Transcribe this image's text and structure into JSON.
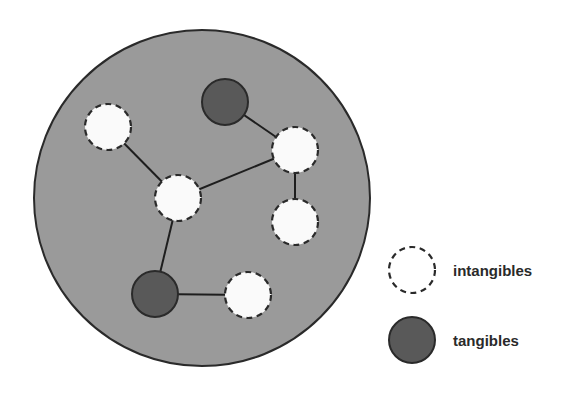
{
  "diagram": {
    "type": "network-in-container",
    "container": {
      "cx": 202,
      "cy": 198,
      "r": 168,
      "fill": "#9a9a9a",
      "stroke": "#2a2a2a"
    },
    "node_radius": 23,
    "colors": {
      "intangible_fill": "#fafafa",
      "intangible_stroke": "#2a2a2a",
      "tangible_fill": "#595959",
      "tangible_stroke": "#2a2a2a",
      "edge": "#1e1e1e"
    },
    "nodes": [
      {
        "id": "n1",
        "kind": "intangible",
        "x": 108,
        "y": 127
      },
      {
        "id": "n2",
        "kind": "tangible",
        "x": 225,
        "y": 102
      },
      {
        "id": "n3",
        "kind": "intangible",
        "x": 295,
        "y": 150
      },
      {
        "id": "n4",
        "kind": "intangible",
        "x": 178,
        "y": 198
      },
      {
        "id": "n5",
        "kind": "intangible",
        "x": 295,
        "y": 222
      },
      {
        "id": "n6",
        "kind": "tangible",
        "x": 155,
        "y": 294
      },
      {
        "id": "n7",
        "kind": "intangible",
        "x": 248,
        "y": 295
      }
    ],
    "edges": [
      [
        "n1",
        "n4"
      ],
      [
        "n2",
        "n3"
      ],
      [
        "n3",
        "n4"
      ],
      [
        "n3",
        "n5"
      ],
      [
        "n4",
        "n6"
      ],
      [
        "n6",
        "n7"
      ]
    ]
  },
  "legend": {
    "items": [
      {
        "kind": "intangible",
        "label": "intangibles",
        "x": 412,
        "y": 270
      },
      {
        "kind": "tangible",
        "label": "tangibles",
        "x": 412,
        "y": 340
      }
    ]
  }
}
